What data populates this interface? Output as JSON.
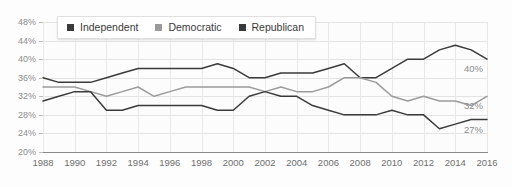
{
  "chart_data": {
    "type": "line",
    "title": "",
    "subtitle": "",
    "xlabel": "",
    "ylabel": "",
    "grid": true,
    "legend_position": "top-left",
    "xlim": [
      1988,
      2016
    ],
    "ylim": [
      20,
      48
    ],
    "ytick_step": 4,
    "x": [
      1988,
      1989,
      1990,
      1991,
      1992,
      1993,
      1994,
      1995,
      1996,
      1997,
      1998,
      1999,
      2000,
      2001,
      2002,
      2003,
      2004,
      2005,
      2006,
      2007,
      2008,
      2009,
      2010,
      2011,
      2012,
      2013,
      2014,
      2015,
      2016
    ],
    "xtick_labels": [
      "1988",
      "1990",
      "1992",
      "1994",
      "1996",
      "1998",
      "2000",
      "2002",
      "2004",
      "2006",
      "2008",
      "2010",
      "2012",
      "2014",
      "2016"
    ],
    "ytick_labels": [
      "48%",
      "44%",
      "40%",
      "36%",
      "32%",
      "28%",
      "24%",
      "20%"
    ],
    "series": [
      {
        "name": "Independent",
        "color": "#3a3a3a",
        "end_label": "40%",
        "values": [
          36,
          35,
          35,
          35,
          36,
          37,
          38,
          38,
          38,
          38,
          38,
          39,
          38,
          36,
          36,
          37,
          37,
          37,
          38,
          39,
          36,
          36,
          38,
          40,
          40,
          42,
          43,
          42,
          40
        ]
      },
      {
        "name": "Democratic",
        "color": "#9b9b9b",
        "end_label": "32%",
        "values": [
          34,
          34,
          34,
          33,
          32,
          33,
          34,
          32,
          33,
          34,
          34,
          34,
          34,
          34,
          33,
          34,
          33,
          33,
          34,
          36,
          36,
          35,
          32,
          31,
          32,
          31,
          31,
          30,
          32
        ]
      },
      {
        "name": "Republican",
        "color": "#3a3a3a",
        "end_label": "27%",
        "values": [
          31,
          32,
          33,
          33,
          29,
          29,
          30,
          30,
          30,
          30,
          30,
          29,
          29,
          32,
          33,
          32,
          32,
          30,
          29,
          28,
          28,
          28,
          29,
          28,
          28,
          25,
          26,
          27,
          27
        ]
      }
    ]
  },
  "legend": {
    "items": [
      {
        "label": "Independent",
        "color": "#3a3a3a"
      },
      {
        "label": "Democratic",
        "color": "#9b9b9b"
      },
      {
        "label": "Republican",
        "color": "#3a3a3a"
      }
    ]
  }
}
